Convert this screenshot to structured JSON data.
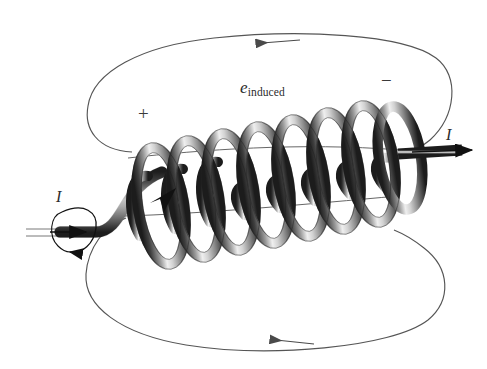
{
  "figure": {
    "background_color": "#ffffff",
    "width": 487,
    "height": 369
  },
  "labels": {
    "emf": {
      "symbol": "e",
      "subscript": "induced",
      "full_text": "e_induced"
    },
    "current_left": "I",
    "current_right": "I",
    "polarity_positive": "+",
    "polarity_negative": "−"
  },
  "colors": {
    "field_line": "#555555",
    "field_arrow": "#4a4a4a",
    "wire_outline": "#1a1a1a",
    "wire_mid": "#8a8a8a",
    "wire_highlight": "#f2f2f2",
    "wire_shadow": "#3c3c3c",
    "text": "#2b2b2b",
    "arrowhead": "#111111"
  },
  "diagram_data": {
    "type": "physics-schematic",
    "subject": "solenoid with induced electromotive force",
    "coil": {
      "turns_visible": 8,
      "axis_start": [
        118,
        214
      ],
      "axis_end": [
        404,
        152
      ],
      "loop_radius_x": 22,
      "loop_radius_y": 58,
      "tube_thickness": 11,
      "tilt_direction": "lower-left to upper-right"
    },
    "field_lines": [
      {
        "name": "upper-field-loop",
        "position": "above coil",
        "arrow_direction": "left",
        "arrow_at": [
          277,
          42
        ]
      },
      {
        "name": "lower-field-loop",
        "position": "below coil",
        "arrow_direction": "left",
        "arrow_at": [
          291,
          341
        ]
      }
    ],
    "current_arrows": [
      {
        "name": "left-lead-current",
        "direction": "right",
        "position": [
          70,
          232
        ],
        "label": "I"
      },
      {
        "name": "right-lead-current",
        "direction": "right",
        "position": [
          452,
          150
        ],
        "label": "I"
      },
      {
        "name": "coil-winding-current",
        "direction": "down-left",
        "position": [
          168,
          205
        ]
      }
    ],
    "rotation_indicator": {
      "name": "current-rotation-ellipse",
      "center": [
        78,
        224
      ],
      "description": "circular arrow around left lead wire showing current circulation"
    },
    "polarity_markers": [
      {
        "sign": "+",
        "position": [
          144,
          115
        ],
        "side": "left"
      },
      {
        "sign": "−",
        "position": [
          388,
          82
        ],
        "side": "right"
      }
    ]
  }
}
